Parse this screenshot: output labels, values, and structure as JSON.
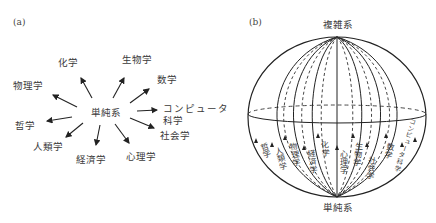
{
  "panel_a": {
    "label": "(a)",
    "center": "単純系",
    "disciplines": [
      {
        "id": "chemistry",
        "label": "化学"
      },
      {
        "id": "biology",
        "label": "生物学"
      },
      {
        "id": "mathematics",
        "label": "数学"
      },
      {
        "id": "physics",
        "label": "物理学"
      },
      {
        "id": "computer_science_1",
        "label": "コンピュータ"
      },
      {
        "id": "computer_science_2",
        "label": "科学"
      },
      {
        "id": "philosophy",
        "label": "哲学"
      },
      {
        "id": "sociology",
        "label": "社会学"
      },
      {
        "id": "anthropology",
        "label": "人類学"
      },
      {
        "id": "economics",
        "label": "経済学"
      },
      {
        "id": "psychology",
        "label": "心理学"
      }
    ]
  },
  "panel_b": {
    "label": "(b)",
    "top": "複雑系",
    "bottom": "単純系",
    "meridian_labels": [
      {
        "id": "philosophy",
        "label": "哲学"
      },
      {
        "id": "anthropology",
        "label": "人類学"
      },
      {
        "id": "physics",
        "label": "物理学"
      },
      {
        "id": "economics",
        "label": "経済学"
      },
      {
        "id": "chemistry",
        "label": "化学"
      },
      {
        "id": "psychology",
        "label": "心理学"
      },
      {
        "id": "biology",
        "label": "生物学"
      },
      {
        "id": "sociology",
        "label": "社会学"
      },
      {
        "id": "mathematics",
        "label": "数学"
      },
      {
        "id": "computer_science",
        "label": "コンピュータ科学"
      }
    ]
  }
}
